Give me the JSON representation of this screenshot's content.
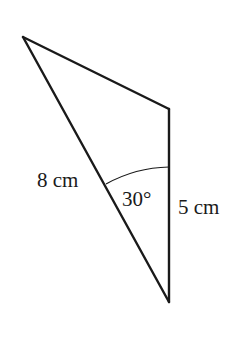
{
  "diagram": {
    "type": "quadrilateral-with-diagonal",
    "labels": {
      "side_slanted": "8 cm",
      "angle": "30°",
      "side_vertical": "5 cm"
    },
    "vertices": {
      "top_left": [
        23,
        37
      ],
      "top_right": [
        169,
        109
      ],
      "bottom": [
        169,
        302
      ]
    },
    "stroke_color": "#1a1a1a",
    "background": "#ffffff"
  }
}
